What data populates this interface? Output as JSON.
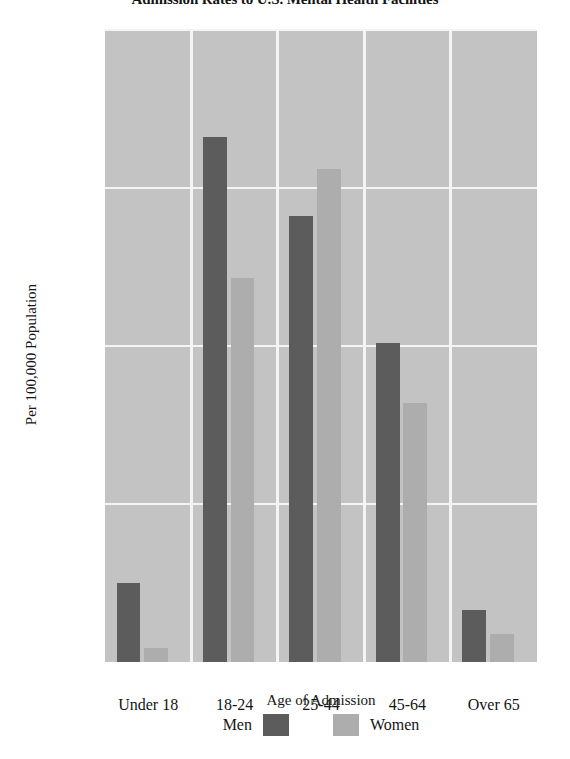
{
  "chart_data": {
    "type": "bar",
    "title": "Admission Rates to U.S. Mental Health Facilities",
    "xlabel": "Age of Admission",
    "ylabel": "Per 100,000 Population",
    "categories": [
      "Under 18",
      "18-24",
      "25-44",
      "45-64",
      "Over 65"
    ],
    "series": [
      {
        "name": "Men",
        "color": "#5c5c5c",
        "values": [
          750,
          2160,
          1910,
          1510,
          665
        ]
      },
      {
        "name": "Women",
        "color": "#adadad",
        "values": [
          545,
          1715,
          2060,
          1320,
          590
        ]
      }
    ],
    "ylim": [
      500,
      2500
    ],
    "yticks": [
      500,
      1000,
      1500,
      2000,
      2500
    ],
    "ytick_labels": [
      "500",
      "1,000",
      "1,500",
      "2,000",
      "2,500"
    ],
    "grid": true,
    "grid_color": "#f4f4f4",
    "plot_background": "#c3c3c3",
    "legend_position": "bottom"
  }
}
